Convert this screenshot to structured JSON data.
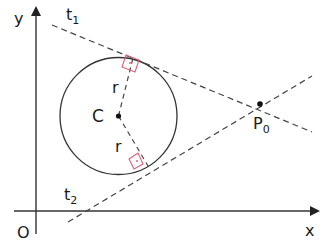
{
  "diagram": {
    "axes": {
      "x_label": "x",
      "y_label": "y",
      "origin_label": "O"
    },
    "circle": {
      "center_label": "C",
      "radius_label": "r",
      "radius_label_2": "r"
    },
    "point": {
      "label_main": "P",
      "label_sub": "0"
    },
    "tangents": [
      {
        "label_main": "t",
        "label_sub": "1"
      },
      {
        "label_main": "t",
        "label_sub": "2"
      }
    ],
    "colors": {
      "line": "#333333",
      "dashed": "#444444",
      "right_angle_marker": "#e0607a"
    }
  }
}
